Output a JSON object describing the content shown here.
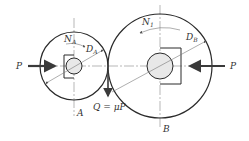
{
  "diagram": {
    "type": "friction-wheel-drive",
    "colors": {
      "line": "#2a2a2a",
      "centerline": "#888888",
      "shaft_fill": "#e8e8e8",
      "force_arrow": "#3a3a3a",
      "background": "#ffffff"
    },
    "wheel_a": {
      "label": "A",
      "diameter_label": "D",
      "diameter_sub": "A",
      "speed_label": "N",
      "speed_sub": "A"
    },
    "wheel_b": {
      "label": "B",
      "diameter_label": "D",
      "diameter_sub": "B",
      "speed_label": "N",
      "speed_sub": "1"
    },
    "forces": {
      "left_press": "P",
      "right_press": "P",
      "friction": "Q = μP"
    }
  }
}
